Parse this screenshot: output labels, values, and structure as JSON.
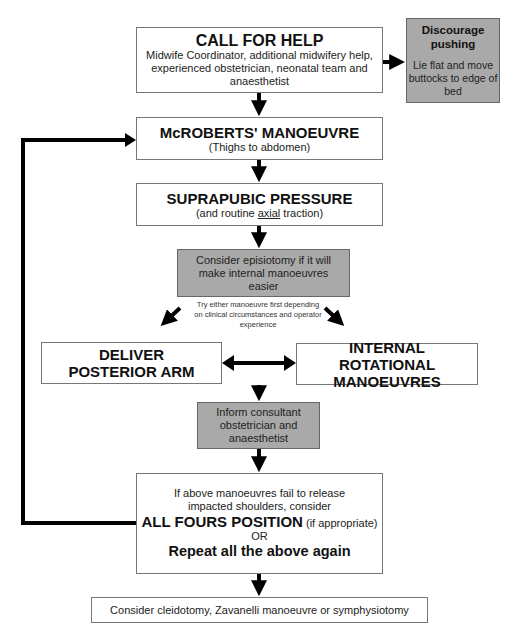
{
  "flowchart": {
    "call_for_help": {
      "title": "CALL FOR HELP",
      "detail": "Midwife Coordinator, additional midwifery help, experienced obstetrician, neonatal team and anaesthetist"
    },
    "discourage_pushing": {
      "title": "Discourage pushing",
      "detail": "Lie flat and move buttocks to edge of bed"
    },
    "mcroberts": {
      "title": "McROBERTS' MANOEUVRE",
      "detail": "(Thighs to abdomen)"
    },
    "suprapubic": {
      "title": "SUPRAPUBIC PRESSURE",
      "detail_prefix": "(and routine ",
      "detail_underlined": "axial",
      "detail_suffix": " traction)"
    },
    "episiotomy": {
      "text": "Consider episiotomy if it will make internal manoeuvres easier"
    },
    "choice_note": {
      "text": "Try either manoeuvre first depending on clinical circumstances and operator experience"
    },
    "posterior_arm": {
      "title": "DELIVER POSTERIOR ARM"
    },
    "internal_rotational": {
      "title": "INTERNAL ROTATIONAL MANOEUVRES"
    },
    "inform": {
      "text": "Inform consultant obstetrician and anaesthetist"
    },
    "repeat": {
      "line1": "If above manoeuvres fail to release impacted shoulders, consider",
      "all_fours": "ALL FOURS POSITION",
      "all_fours_note": " (if appropriate)",
      "or": "OR",
      "repeat_text": "Repeat all the above again"
    },
    "final": {
      "text": "Consider cleidotomy, Zavanelli manoeuvre or symphysiotomy"
    }
  },
  "colors": {
    "grey_box": "#a9a9a9",
    "arrow": "#000000",
    "border": "#777777"
  }
}
